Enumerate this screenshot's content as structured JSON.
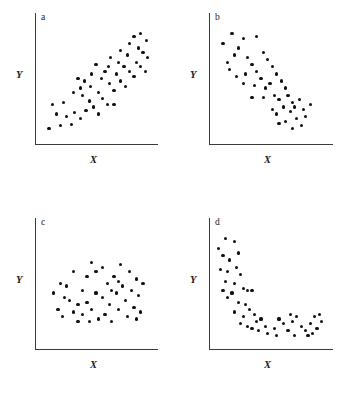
{
  "figure": {
    "caption": "",
    "width": 347,
    "height": 393,
    "background": "#ffffff",
    "dot_color": "#111111",
    "axis_color": "#3a3a3a"
  },
  "panels": [
    {
      "letter": "a",
      "xlabel": "X",
      "ylabel": "Y",
      "relationship": "strong positive linear association"
    },
    {
      "letter": "b",
      "xlabel": "X",
      "ylabel": "Y",
      "relationship": "strong negative linear association"
    },
    {
      "letter": "c",
      "xlabel": "X",
      "ylabel": "Y",
      "relationship": "no association (random cloud)"
    },
    {
      "letter": "d",
      "xlabel": "X",
      "ylabel": "Y",
      "relationship": "nonlinear decreasing (curvilinear) association"
    }
  ],
  "chart_data": [
    {
      "type": "scatter",
      "title": "a",
      "xlabel": "X",
      "ylabel": "Y",
      "xlim": [
        0,
        100
      ],
      "ylim": [
        0,
        100
      ],
      "grid": false,
      "legend": "none",
      "points": [
        [
          8,
          10
        ],
        [
          18,
          12
        ],
        [
          28,
          13
        ],
        [
          15,
          22
        ],
        [
          24,
          20
        ],
        [
          11,
          30
        ],
        [
          21,
          32
        ],
        [
          31,
          23
        ],
        [
          36,
          18
        ],
        [
          41,
          25
        ],
        [
          30,
          40
        ],
        [
          38,
          38
        ],
        [
          44,
          33
        ],
        [
          48,
          28
        ],
        [
          45,
          45
        ],
        [
          34,
          52
        ],
        [
          40,
          50
        ],
        [
          52,
          40
        ],
        [
          56,
          35
        ],
        [
          60,
          30
        ],
        [
          46,
          56
        ],
        [
          55,
          52
        ],
        [
          62,
          48
        ],
        [
          58,
          58
        ],
        [
          66,
          42
        ],
        [
          50,
          64
        ],
        [
          61,
          62
        ],
        [
          68,
          56
        ],
        [
          72,
          50
        ],
        [
          76,
          45
        ],
        [
          63,
          70
        ],
        [
          70,
          66
        ],
        [
          75,
          62
        ],
        [
          80,
          58
        ],
        [
          84,
          54
        ],
        [
          72,
          76
        ],
        [
          78,
          72
        ],
        [
          86,
          66
        ],
        [
          90,
          62
        ],
        [
          94,
          58
        ],
        [
          80,
          82
        ],
        [
          88,
          78
        ],
        [
          92,
          74
        ],
        [
          96,
          70
        ],
        [
          84,
          88
        ],
        [
          90,
          90
        ],
        [
          95,
          84
        ],
        [
          66,
          30
        ],
        [
          52,
          22
        ],
        [
          36,
          44
        ]
      ]
    },
    {
      "type": "scatter",
      "title": "b",
      "xlabel": "X",
      "ylabel": "Y",
      "xlim": [
        0,
        100
      ],
      "ylim": [
        0,
        100
      ],
      "grid": false,
      "legend": "none",
      "points": [
        [
          8,
          82
        ],
        [
          16,
          90
        ],
        [
          26,
          86
        ],
        [
          38,
          88
        ],
        [
          18,
          72
        ],
        [
          22,
          78
        ],
        [
          12,
          66
        ],
        [
          14,
          60
        ],
        [
          30,
          70
        ],
        [
          34,
          64
        ],
        [
          44,
          74
        ],
        [
          48,
          68
        ],
        [
          28,
          56
        ],
        [
          38,
          58
        ],
        [
          42,
          52
        ],
        [
          52,
          62
        ],
        [
          56,
          56
        ],
        [
          36,
          46
        ],
        [
          46,
          44
        ],
        [
          50,
          48
        ],
        [
          60,
          50
        ],
        [
          64,
          44
        ],
        [
          54,
          38
        ],
        [
          58,
          34
        ],
        [
          44,
          36
        ],
        [
          66,
          38
        ],
        [
          70,
          32
        ],
        [
          62,
          28
        ],
        [
          52,
          26
        ],
        [
          56,
          22
        ],
        [
          68,
          24
        ],
        [
          72,
          28
        ],
        [
          76,
          34
        ],
        [
          80,
          26
        ],
        [
          74,
          18
        ],
        [
          64,
          16
        ],
        [
          58,
          14
        ],
        [
          82,
          20
        ],
        [
          86,
          30
        ],
        [
          70,
          10
        ],
        [
          78,
          12
        ],
        [
          34,
          36
        ],
        [
          26,
          48
        ],
        [
          20,
          54
        ]
      ]
    },
    {
      "type": "scatter",
      "title": "c",
      "xlabel": "X",
      "ylabel": "Y",
      "xlim": [
        0,
        100
      ],
      "ylim": [
        0,
        100
      ],
      "grid": false,
      "legend": "none",
      "points": [
        [
          12,
          44
        ],
        [
          16,
          30
        ],
        [
          20,
          24
        ],
        [
          24,
          50
        ],
        [
          26,
          38
        ],
        [
          30,
          62
        ],
        [
          30,
          28
        ],
        [
          34,
          34
        ],
        [
          34,
          20
        ],
        [
          38,
          46
        ],
        [
          38,
          26
        ],
        [
          42,
          58
        ],
        [
          42,
          36
        ],
        [
          46,
          70
        ],
        [
          46,
          30
        ],
        [
          50,
          44
        ],
        [
          52,
          22
        ],
        [
          56,
          66
        ],
        [
          56,
          40
        ],
        [
          58,
          26
        ],
        [
          60,
          52
        ],
        [
          62,
          34
        ],
        [
          64,
          20
        ],
        [
          66,
          58
        ],
        [
          68,
          44
        ],
        [
          70,
          30
        ],
        [
          72,
          68
        ],
        [
          74,
          50
        ],
        [
          76,
          38
        ],
        [
          78,
          24
        ],
        [
          80,
          62
        ],
        [
          82,
          46
        ],
        [
          84,
          32
        ],
        [
          86,
          56
        ],
        [
          88,
          42
        ],
        [
          90,
          28
        ],
        [
          92,
          52
        ],
        [
          50,
          62
        ],
        [
          22,
          40
        ],
        [
          18,
          52
        ],
        [
          64,
          46
        ],
        [
          44,
          20
        ],
        [
          70,
          54
        ],
        [
          86,
          22
        ]
      ]
    },
    {
      "type": "scatter",
      "title": "d",
      "xlabel": "X",
      "ylabel": "Y",
      "xlim": [
        0,
        100
      ],
      "ylim": [
        0,
        100
      ],
      "grid": false,
      "legend": "none",
      "points": [
        [
          4,
          82
        ],
        [
          10,
          90
        ],
        [
          18,
          88
        ],
        [
          8,
          76
        ],
        [
          14,
          72
        ],
        [
          22,
          78
        ],
        [
          6,
          64
        ],
        [
          12,
          62
        ],
        [
          20,
          66
        ],
        [
          24,
          60
        ],
        [
          10,
          54
        ],
        [
          18,
          52
        ],
        [
          8,
          46
        ],
        [
          16,
          44
        ],
        [
          26,
          48
        ],
        [
          30,
          46
        ],
        [
          34,
          46
        ],
        [
          22,
          36
        ],
        [
          28,
          34
        ],
        [
          12,
          40
        ],
        [
          18,
          28
        ],
        [
          26,
          24
        ],
        [
          32,
          30
        ],
        [
          36,
          26
        ],
        [
          24,
          18
        ],
        [
          30,
          16
        ],
        [
          38,
          20
        ],
        [
          34,
          14
        ],
        [
          42,
          22
        ],
        [
          46,
          16
        ],
        [
          40,
          12
        ],
        [
          48,
          10
        ],
        [
          54,
          14
        ],
        [
          58,
          22
        ],
        [
          62,
          18
        ],
        [
          66,
          12
        ],
        [
          70,
          20
        ],
        [
          74,
          24
        ],
        [
          78,
          16
        ],
        [
          82,
          12
        ],
        [
          86,
          18
        ],
        [
          90,
          24
        ],
        [
          92,
          14
        ],
        [
          96,
          20
        ],
        [
          84,
          8
        ],
        [
          88,
          10
        ],
        [
          72,
          8
        ],
        [
          56,
          8
        ],
        [
          94,
          26
        ],
        [
          68,
          26
        ]
      ]
    }
  ]
}
